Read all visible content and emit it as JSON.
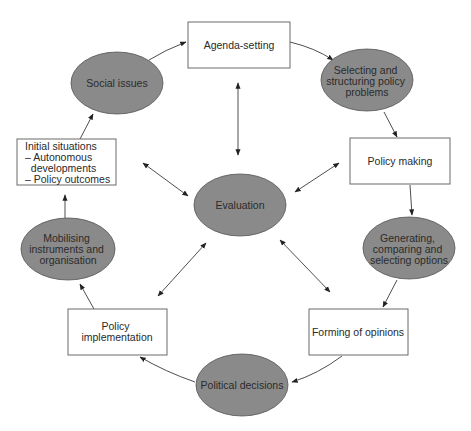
{
  "colors": {
    "ellipse_fill": "#8a8a8a",
    "box_fill": "#ffffff",
    "stroke": "#3a3a3a"
  },
  "nodes": {
    "agenda_setting": {
      "shape": "rect",
      "lines": [
        "Agenda-setting"
      ]
    },
    "selecting_problems": {
      "shape": "ellipse",
      "lines": [
        "Selecting and",
        "structuring policy",
        "problems"
      ]
    },
    "policy_making": {
      "shape": "rect",
      "lines": [
        "Policy making"
      ]
    },
    "generating_options": {
      "shape": "ellipse",
      "lines": [
        "Generating,",
        "comparing and",
        "selecting options"
      ]
    },
    "forming_opinions": {
      "shape": "rect",
      "lines": [
        "Forming of opinions"
      ]
    },
    "political_decisions": {
      "shape": "ellipse",
      "lines": [
        "Political decisions"
      ]
    },
    "policy_implementation": {
      "shape": "rect",
      "lines": [
        "Policy",
        "implementation"
      ]
    },
    "mobilising": {
      "shape": "ellipse",
      "lines": [
        "Mobilising",
        "instruments and",
        "organisation"
      ]
    },
    "initial_situations": {
      "shape": "rect",
      "lines": [
        "Initial situations",
        "– Autonomous",
        "  developments",
        "– Policy outcomes"
      ]
    },
    "social_issues": {
      "shape": "ellipse",
      "lines": [
        "Social issues"
      ]
    },
    "evaluation": {
      "shape": "ellipse",
      "lines": [
        "Evaluation"
      ]
    }
  },
  "cycle_edges": [
    [
      "social_issues",
      "agenda_setting"
    ],
    [
      "agenda_setting",
      "selecting_problems"
    ],
    [
      "selecting_problems",
      "policy_making"
    ],
    [
      "policy_making",
      "generating_options"
    ],
    [
      "generating_options",
      "forming_opinions"
    ],
    [
      "forming_opinions",
      "political_decisions"
    ],
    [
      "political_decisions",
      "policy_implementation"
    ],
    [
      "policy_implementation",
      "mobilising"
    ],
    [
      "mobilising",
      "initial_situations"
    ],
    [
      "initial_situations",
      "social_issues"
    ]
  ],
  "evaluation_links": [
    "agenda_setting",
    "policy_making",
    "forming_opinions",
    "policy_implementation",
    "initial_situations"
  ]
}
